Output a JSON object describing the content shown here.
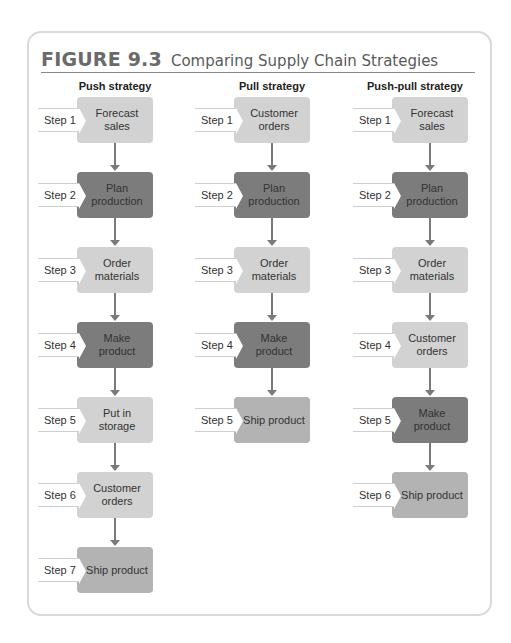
{
  "figure": {
    "number": "FIGURE 9.3",
    "title": "Comparing Supply Chain Strategies"
  },
  "colors": {
    "light": "#d2d2d2",
    "medium": "#b3b3b3",
    "dark": "#7c7c7c",
    "card_border": "#d9d9d9"
  },
  "columns": [
    {
      "heading": "Push strategy",
      "steps": [
        {
          "label": "Step 1",
          "text": "Forecast sales",
          "shade": "light"
        },
        {
          "label": "Step 2",
          "text": "Plan production",
          "shade": "dark"
        },
        {
          "label": "Step 3",
          "text": "Order materials",
          "shade": "light"
        },
        {
          "label": "Step 4",
          "text": "Make product",
          "shade": "dark"
        },
        {
          "label": "Step 5",
          "text": "Put in storage",
          "shade": "light"
        },
        {
          "label": "Step 6",
          "text": "Customer orders",
          "shade": "light"
        },
        {
          "label": "Step 7",
          "text": "Ship product",
          "shade": "medium"
        }
      ]
    },
    {
      "heading": "Pull strategy",
      "steps": [
        {
          "label": "Step 1",
          "text": "Customer orders",
          "shade": "light"
        },
        {
          "label": "Step 2",
          "text": "Plan production",
          "shade": "dark"
        },
        {
          "label": "Step 3",
          "text": "Order materials",
          "shade": "light"
        },
        {
          "label": "Step 4",
          "text": "Make product",
          "shade": "dark"
        },
        {
          "label": "Step 5",
          "text": "Ship product",
          "shade": "medium"
        }
      ]
    },
    {
      "heading": "Push-pull strategy",
      "steps": [
        {
          "label": "Step 1",
          "text": "Forecast sales",
          "shade": "light"
        },
        {
          "label": "Step 2",
          "text": "Plan production",
          "shade": "dark"
        },
        {
          "label": "Step 3",
          "text": "Order materials",
          "shade": "light"
        },
        {
          "label": "Step 4",
          "text": "Customer orders",
          "shade": "light"
        },
        {
          "label": "Step 5",
          "text": "Make product",
          "shade": "dark"
        },
        {
          "label": "Step 6",
          "text": "Ship product",
          "shade": "medium"
        }
      ]
    }
  ]
}
